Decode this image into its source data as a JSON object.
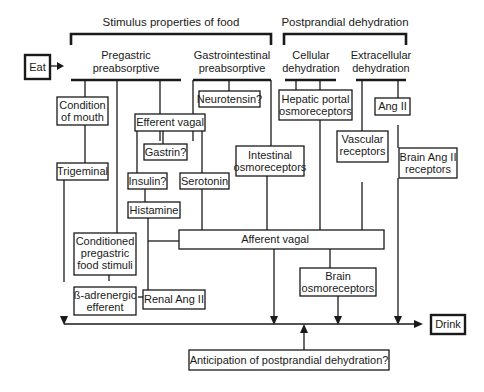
{
  "headers": {
    "stimulus": "Stimulus properties of food",
    "postprandial": "Postprandial dehydration"
  },
  "categories": {
    "pregastric": [
      "Pregastric",
      "preabsorptive"
    ],
    "gastrointestinal": [
      "Gastrointestinal",
      "preabsorptive"
    ],
    "cellular": [
      "Cellular",
      "dehydration"
    ],
    "extracellular": [
      "Extracellular",
      "dehydration"
    ]
  },
  "nodes": {
    "eat": "Eat",
    "drink": "Drink",
    "condition_of_mouth": [
      "Condition",
      "of mouth"
    ],
    "trigeminal": "Trigeminal",
    "efferent_vagal": "Efferent vagal",
    "gastrin": "Gastrin?",
    "insulin": "Insulin?",
    "serotonin": "Serotonin",
    "histamine": "Histamine",
    "neurotensin": "Neurotensin?",
    "intestinal_osmoreceptors": [
      "Intestinal",
      "osmoreceptors"
    ],
    "hepatic_portal": [
      "Hepatic portal",
      "osmoreceptors"
    ],
    "vascular_receptors": [
      "Vascular",
      "receptors"
    ],
    "ang_ii": "Ang II",
    "brain_ang_ii": [
      "Brain Ang II",
      "receptors"
    ],
    "afferent_vagal": "Afferent vagal",
    "conditioned": [
      "Conditioned",
      "pregastric",
      "food stimuli"
    ],
    "beta_adrenergic": [
      "ß-adrenergic",
      "efferent"
    ],
    "renal_ang_ii": "Renal Ang II",
    "brain_osmoreceptors": [
      "Brain",
      "osmoreceptors"
    ],
    "anticipation": "Anticipation of postprandial dehydration?"
  }
}
